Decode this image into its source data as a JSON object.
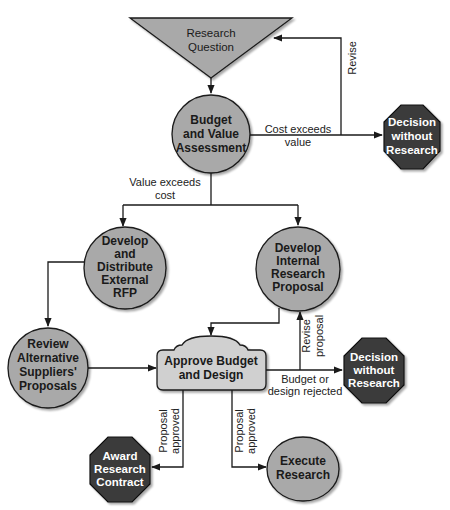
{
  "colors": {
    "circle_fill": "#a9a9a9",
    "triangle_fill": "#a9a9a9",
    "box_fill": "#d0d0d0",
    "octagon_fill": "#3a3a3a",
    "stroke": "#1a1a1a"
  },
  "nodes": {
    "research_question": {
      "shape": "inverted-triangle",
      "lines": [
        "Research",
        "Question"
      ]
    },
    "budget_value": {
      "shape": "circle",
      "lines": [
        "Budget",
        "and Value",
        "Assessment"
      ]
    },
    "decision_1": {
      "shape": "octagon",
      "lines": [
        "Decision",
        "without",
        "Research"
      ]
    },
    "external_rfp": {
      "shape": "circle",
      "lines": [
        "Develop",
        "and",
        "Distribute",
        "External",
        "RFP"
      ]
    },
    "internal_proposal": {
      "shape": "circle",
      "lines": [
        "Develop",
        "Internal",
        "Research",
        "Proposal"
      ]
    },
    "review_suppliers": {
      "shape": "circle",
      "lines": [
        "Review",
        "Alternative",
        "Suppliers'",
        "Proposals"
      ]
    },
    "approve": {
      "shape": "rounded-box",
      "lines": [
        "Approve Budget",
        "and Design"
      ]
    },
    "decision_2": {
      "shape": "octagon",
      "lines": [
        "Decision",
        "without",
        "Research"
      ]
    },
    "award_contract": {
      "shape": "octagon",
      "lines": [
        "Award",
        "Research",
        "Contract"
      ]
    },
    "execute": {
      "shape": "ellipse",
      "lines": [
        "Execute",
        "Research"
      ]
    }
  },
  "edges": {
    "revise": {
      "lines": [
        "Revise"
      ]
    },
    "cost_exceeds": {
      "lines": [
        "Cost exceeds",
        "value"
      ]
    },
    "value_exceeds": {
      "lines": [
        "Value exceeds",
        "cost"
      ]
    },
    "revise_proposal": {
      "lines": [
        "Revise",
        "proposal"
      ]
    },
    "rejected": {
      "lines": [
        "Budget or",
        "design rejected"
      ]
    },
    "approved_left": {
      "lines": [
        "Proposal",
        "approved"
      ]
    },
    "approved_right": {
      "lines": [
        "Proposal",
        "approved"
      ]
    }
  }
}
